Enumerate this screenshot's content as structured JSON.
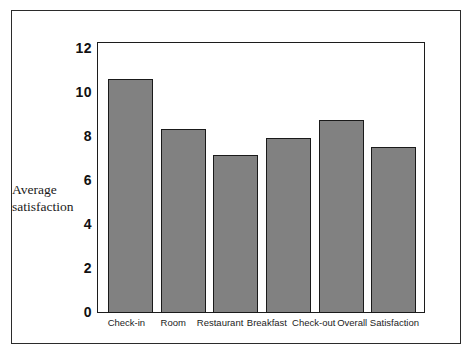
{
  "chart_data": {
    "type": "bar",
    "title": "",
    "subtitle": "",
    "xlabel": "",
    "ylabel": "Average satisfaction",
    "ylabel_lines": [
      "Average",
      "satisfaction"
    ],
    "categories": [
      "Check-in",
      "Room",
      "Restaurant",
      "Breakfast",
      "Check-out",
      "Overall Satisfaction"
    ],
    "values": [
      10.45,
      8.2,
      7.05,
      7.8,
      8.6,
      7.4
    ],
    "ylim": [
      0,
      12
    ],
    "yticks": [
      0,
      2,
      4,
      6,
      8,
      10,
      12
    ],
    "ytick_labels": [
      "0",
      "2",
      "4",
      "6",
      "8",
      "10",
      "12"
    ],
    "grid": false,
    "legend": null,
    "bar_color": "#818181",
    "bar_edge_color": "#1a1a1a",
    "frame_color": "#1c1c1c",
    "background": "#ffffff"
  }
}
